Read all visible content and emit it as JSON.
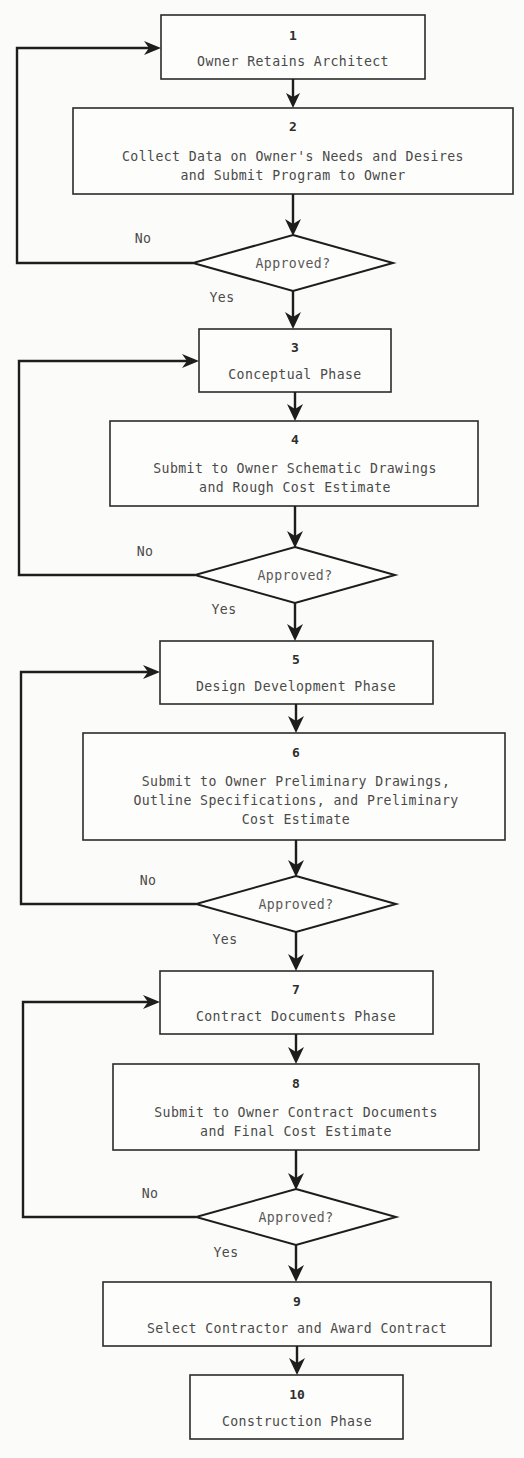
{
  "diagram": {
    "background_color": "#fbfbf9",
    "line_color": "#1d1d1d",
    "text_color": "#4a4a4a"
  },
  "nodes": [
    {
      "id": "n1",
      "number": "1",
      "shape": "process",
      "lines": [
        "Owner Retains Architect"
      ]
    },
    {
      "id": "n2",
      "number": "2",
      "shape": "process",
      "lines": [
        "Collect Data on Owner's Needs and Desires",
        "and Submit Program to Owner"
      ]
    },
    {
      "id": "d1",
      "number": "",
      "shape": "decision",
      "lines": [
        "Approved?"
      ]
    },
    {
      "id": "n3",
      "number": "3",
      "shape": "process",
      "lines": [
        "Conceptual Phase"
      ]
    },
    {
      "id": "n4",
      "number": "4",
      "shape": "process",
      "lines": [
        "Submit to Owner Schematic Drawings",
        "and Rough Cost Estimate"
      ]
    },
    {
      "id": "d2",
      "number": "",
      "shape": "decision",
      "lines": [
        "Approved?"
      ]
    },
    {
      "id": "n5",
      "number": "5",
      "shape": "process",
      "lines": [
        "Design Development Phase"
      ]
    },
    {
      "id": "n6",
      "number": "6",
      "shape": "process",
      "lines": [
        "Submit to Owner Preliminary Drawings,",
        "Outline Specifications, and Preliminary",
        "Cost Estimate"
      ]
    },
    {
      "id": "d3",
      "number": "",
      "shape": "decision",
      "lines": [
        "Approved?"
      ]
    },
    {
      "id": "n7",
      "number": "7",
      "shape": "process",
      "lines": [
        "Contract Documents Phase"
      ]
    },
    {
      "id": "n8",
      "number": "8",
      "shape": "process",
      "lines": [
        "Submit to Owner Contract Documents",
        "and Final Cost Estimate"
      ]
    },
    {
      "id": "d4",
      "number": "",
      "shape": "decision",
      "lines": [
        "Approved?"
      ]
    },
    {
      "id": "n9",
      "number": "9",
      "shape": "process",
      "lines": [
        "Select Contractor and Award Contract"
      ]
    },
    {
      "id": "n10",
      "number": "10",
      "shape": "process",
      "lines": [
        "Construction Phase"
      ]
    }
  ],
  "branch_labels": {
    "no": "No",
    "yes": "Yes"
  },
  "edges": [
    {
      "from": "n1",
      "to": "n2",
      "label": ""
    },
    {
      "from": "n2",
      "to": "d1",
      "label": ""
    },
    {
      "from": "d1",
      "to": "n3",
      "label": "Yes"
    },
    {
      "from": "d1",
      "to": "n1",
      "label": "No"
    },
    {
      "from": "n3",
      "to": "n4",
      "label": ""
    },
    {
      "from": "n4",
      "to": "d2",
      "label": ""
    },
    {
      "from": "d2",
      "to": "n5",
      "label": "Yes"
    },
    {
      "from": "d2",
      "to": "n3",
      "label": "No"
    },
    {
      "from": "n5",
      "to": "n6",
      "label": ""
    },
    {
      "from": "n6",
      "to": "d3",
      "label": ""
    },
    {
      "from": "d3",
      "to": "n7",
      "label": "Yes"
    },
    {
      "from": "d3",
      "to": "n5",
      "label": "No"
    },
    {
      "from": "n7",
      "to": "n8",
      "label": ""
    },
    {
      "from": "n8",
      "to": "d4",
      "label": ""
    },
    {
      "from": "d4",
      "to": "n9",
      "label": "Yes"
    },
    {
      "from": "d4",
      "to": "n7",
      "label": "No"
    },
    {
      "from": "n9",
      "to": "n10",
      "label": ""
    }
  ]
}
